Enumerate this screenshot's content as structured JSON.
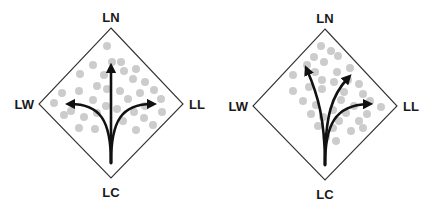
{
  "panels": [
    {
      "id": "left",
      "labels": {
        "top": "LN",
        "left": "LW",
        "right": "LL",
        "bottom": "LC"
      },
      "description": "Three arrows from LC: straight up to LN, curving left to LW, curving right to LL; dots spread evenly across upper diamond"
    },
    {
      "id": "right",
      "labels": {
        "top": "LN",
        "left": "LW",
        "right": "LL",
        "bottom": "LC"
      },
      "description": "Three arrows from LC all bending toward the right half (toward LN/LL); dots concentrated on the right side of the diamond"
    }
  ],
  "colors": {
    "dots": "#cccccc",
    "arrows": "#111111",
    "outline": "#333333",
    "text": "#1a1a1a"
  }
}
